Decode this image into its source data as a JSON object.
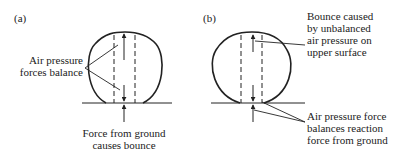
{
  "panels": [
    {
      "tag": "(a)",
      "labels": {
        "air_pressure": [
          "Air pressure",
          "forces balance"
        ],
        "ground_force": [
          "Force from ground",
          "causes bounce"
        ]
      }
    },
    {
      "tag": "(b)",
      "labels": {
        "bounce": [
          "Bounce caused",
          "by unbalanced",
          "air pressure on",
          "upper surface"
        ],
        "balance": [
          "Air pressure force",
          "balances reaction",
          "force from ground"
        ]
      }
    }
  ],
  "colors": {
    "stroke": "#222222",
    "background": "#ffffff"
  }
}
